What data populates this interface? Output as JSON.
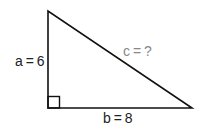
{
  "diagram": {
    "type": "right-triangle",
    "vertices": {
      "top": [
        48,
        11
      ],
      "right_angle": [
        48,
        108
      ],
      "right": [
        192,
        108
      ]
    },
    "labels": {
      "side_a": "a = 6",
      "side_b": "b = 8",
      "hypotenuse": "c = ?"
    },
    "colors": {
      "stroke": "#111111",
      "label": "#222222",
      "unknown_label": "#888888"
    }
  }
}
